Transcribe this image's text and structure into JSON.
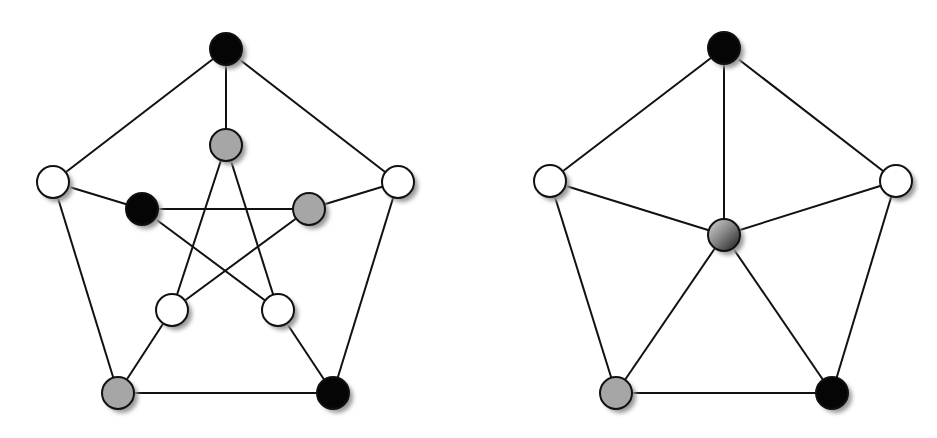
{
  "diagram": {
    "node_radius": 16,
    "edge_color": "#111111",
    "edge_width": 2,
    "colors": {
      "black": "#050505",
      "gray": "#a6a6a6",
      "white": "#ffffff",
      "stroke": "#111111",
      "shadow": "#9a9a9a"
    },
    "graphs": [
      {
        "name": "petersen-graph",
        "nodes": [
          {
            "id": "o0",
            "x": 226,
            "y": 49,
            "fill": "black"
          },
          {
            "id": "o1",
            "x": 398,
            "y": 182,
            "fill": "white"
          },
          {
            "id": "o2",
            "x": 333,
            "y": 393,
            "fill": "black"
          },
          {
            "id": "o3",
            "x": 118,
            "y": 393,
            "fill": "gray"
          },
          {
            "id": "o4",
            "x": 53,
            "y": 182,
            "fill": "white"
          },
          {
            "id": "i0",
            "x": 226,
            "y": 145,
            "fill": "gray"
          },
          {
            "id": "i1",
            "x": 309,
            "y": 209,
            "fill": "gray"
          },
          {
            "id": "i2",
            "x": 278,
            "y": 310,
            "fill": "white"
          },
          {
            "id": "i3",
            "x": 172,
            "y": 310,
            "fill": "white"
          },
          {
            "id": "i4",
            "x": 142,
            "y": 209,
            "fill": "black"
          }
        ],
        "edges": [
          [
            "o0",
            "o1"
          ],
          [
            "o1",
            "o2"
          ],
          [
            "o2",
            "o3"
          ],
          [
            "o3",
            "o4"
          ],
          [
            "o4",
            "o0"
          ],
          [
            "o0",
            "i0"
          ],
          [
            "o1",
            "i1"
          ],
          [
            "o2",
            "i2"
          ],
          [
            "o3",
            "i3"
          ],
          [
            "o4",
            "i4"
          ],
          [
            "i0",
            "i2"
          ],
          [
            "i0",
            "i3"
          ],
          [
            "i1",
            "i3"
          ],
          [
            "i1",
            "i4"
          ],
          [
            "i4",
            "i2"
          ]
        ]
      },
      {
        "name": "wheel-graph",
        "nodes": [
          {
            "id": "w0",
            "x": 724,
            "y": 48,
            "fill": "black"
          },
          {
            "id": "w1",
            "x": 896,
            "y": 181,
            "fill": "white"
          },
          {
            "id": "w2",
            "x": 832,
            "y": 393,
            "fill": "black"
          },
          {
            "id": "w3",
            "x": 616,
            "y": 393,
            "fill": "gray"
          },
          {
            "id": "w4",
            "x": 550,
            "y": 181,
            "fill": "white"
          },
          {
            "id": "c",
            "x": 724,
            "y": 235,
            "fill": "gradient"
          }
        ],
        "edges": [
          [
            "w0",
            "w1"
          ],
          [
            "w1",
            "w2"
          ],
          [
            "w2",
            "w3"
          ],
          [
            "w3",
            "w4"
          ],
          [
            "w4",
            "w0"
          ],
          [
            "c",
            "w0"
          ],
          [
            "c",
            "w1"
          ],
          [
            "c",
            "w2"
          ],
          [
            "c",
            "w3"
          ],
          [
            "c",
            "w4"
          ]
        ]
      }
    ]
  }
}
